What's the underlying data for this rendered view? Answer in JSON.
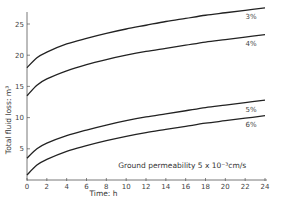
{
  "chart_data": {
    "type": "line",
    "title": "",
    "xlabel": "Time: h",
    "ylabel": "Total fluid loss: m³",
    "xlim": [
      0,
      24
    ],
    "ylim": [
      0,
      27
    ],
    "xticks": [
      0,
      2,
      4,
      6,
      8,
      10,
      12,
      14,
      16,
      18,
      20,
      22,
      24
    ],
    "yticks": [
      0,
      5,
      10,
      15,
      20,
      25
    ],
    "grid": false,
    "annotation": "Ground permeability  5 x 10⁻³cm/s",
    "x": [
      0,
      1,
      2,
      4,
      6,
      8,
      10,
      12,
      14,
      16,
      18,
      20,
      22,
      24
    ],
    "series": [
      {
        "name": "3%",
        "values": [
          18.0,
          19.6,
          20.5,
          21.8,
          22.7,
          23.5,
          24.2,
          24.8,
          25.4,
          25.9,
          26.4,
          26.8,
          27.2,
          27.6
        ]
      },
      {
        "name": "4%",
        "values": [
          13.5,
          15.2,
          16.2,
          17.5,
          18.5,
          19.3,
          20.0,
          20.6,
          21.1,
          21.6,
          22.1,
          22.5,
          22.9,
          23.3
        ]
      },
      {
        "name": "5%",
        "values": [
          3.5,
          5.0,
          5.9,
          7.1,
          8.0,
          8.8,
          9.5,
          10.1,
          10.6,
          11.1,
          11.6,
          12.0,
          12.4,
          12.8
        ]
      },
      {
        "name": "6%",
        "values": [
          0.8,
          2.4,
          3.3,
          4.6,
          5.5,
          6.3,
          7.0,
          7.6,
          8.1,
          8.6,
          9.1,
          9.5,
          9.9,
          10.3
        ]
      }
    ]
  }
}
